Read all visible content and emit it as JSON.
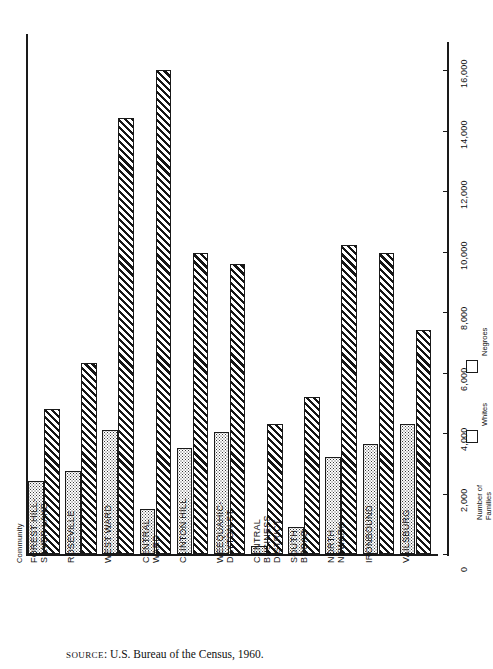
{
  "chart_data": {
    "type": "bar",
    "title": "",
    "xlabel": "Community",
    "ylabel": "Number of Families",
    "orientation": "vertical",
    "grid": false,
    "ylim": [
      0,
      17000
    ],
    "yticks": [
      0,
      2000,
      4000,
      6000,
      8000,
      10000,
      12000,
      14000,
      16000
    ],
    "ytick_labels": [
      "0",
      "2,000",
      "4,000",
      "6,000",
      "8,000",
      "10,000",
      "12,000",
      "14,000",
      "16,000"
    ],
    "legend_position": "right",
    "categories": [
      "FOREST HILL-\nSILVER LAKE",
      "ROSEVILLE",
      "WEST WARD",
      "CENTRAL\nWARD",
      "CLINTON HILL",
      "WEEQUAHIC-\nDAYTON ST.",
      "CENTRAL\nBUSINESS\nDISTRICT",
      "SOUTH\nBROAD",
      "NORTH\nNEWARK",
      "IRONBOUND",
      "VAILSBURG"
    ],
    "series": [
      {
        "name": "Whites",
        "pattern": "dotted",
        "values": [
          2400,
          2750,
          4100,
          1500,
          3500,
          4050,
          250,
          900,
          3200,
          3650,
          4300
        ]
      },
      {
        "name": "Negroes",
        "pattern": "diagonal-hatch",
        "values": [
          4800,
          6300,
          14400,
          16000,
          9950,
          9600,
          4300,
          5200,
          10200,
          9950,
          7400
        ]
      }
    ]
  },
  "axis": {
    "category_caption": "Community",
    "tick_labels": [
      "0",
      "2,000",
      "4,000",
      "6,000",
      "8,000",
      "10,000",
      "12,000",
      "14,000",
      "16,000"
    ]
  },
  "legend": {
    "title": "Number of\nFamilies",
    "items": [
      {
        "label": "Negroes",
        "pattern": "diagonal-hatch"
      },
      {
        "label": "Whites",
        "pattern": "dotted"
      }
    ]
  },
  "footer": {
    "source_prefix": "SOURCE",
    "source_text": ": U.S. Bureau of the Census, 1960."
  }
}
